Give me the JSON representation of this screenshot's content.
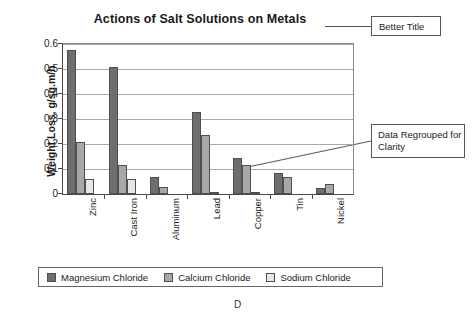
{
  "figure": {
    "label": "D"
  },
  "annotations": [
    {
      "name": "better-title",
      "text": "Better Title"
    },
    {
      "name": "data-regrouped",
      "text": "Data Regrouped for Clarity"
    }
  ],
  "legend_box": {
    "position": "bottom"
  },
  "chart_data": {
    "type": "bar",
    "title": "Actions of Salt Solutions on Metals",
    "xlabel": "",
    "ylabel": "Weight Loss, g/sq.m/h",
    "categories": [
      "Zinc",
      "Cast Iron",
      "Aluminum",
      "Lead",
      "Copper",
      "Tin",
      "Nickel"
    ],
    "series": [
      {
        "name": "Magnesium Chloride",
        "color": "#6e6e6e",
        "values": [
          0.575,
          0.51,
          0.07,
          0.33,
          0.145,
          0.085,
          0.025
        ]
      },
      {
        "name": "Calcium Chloride",
        "color": "#a8a8a8",
        "values": [
          0.21,
          0.115,
          0.03,
          0.235,
          0.115,
          0.07,
          0.04
        ]
      },
      {
        "name": "Sodium Chloride",
        "color": "#e6e6e6",
        "values": [
          0.06,
          0.06,
          0.0,
          0.01,
          0.01,
          0.0,
          0.0
        ]
      }
    ],
    "ylim": [
      0,
      0.6
    ],
    "yticks": [
      0,
      0.1,
      0.2,
      0.3,
      0.4,
      0.5,
      0.6
    ],
    "ytick_labels": [
      "0",
      "0.1",
      "0.2",
      "0.3",
      "0.4",
      "0.5",
      "0.6"
    ],
    "grid": true,
    "legend_position": "bottom"
  }
}
